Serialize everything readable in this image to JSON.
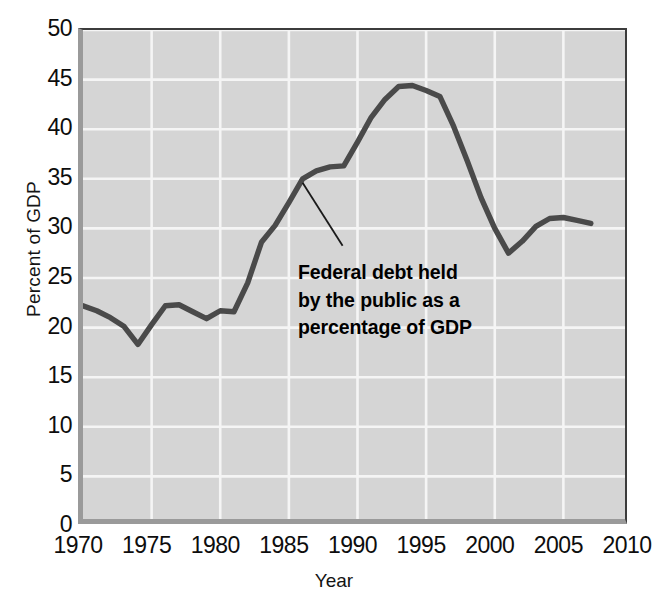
{
  "chart_data": {
    "type": "line",
    "title": "",
    "xlabel": "Year",
    "ylabel": "Percent of GDP",
    "xlim": [
      1970,
      2010
    ],
    "ylim": [
      0,
      50
    ],
    "grid": true,
    "legend": "none",
    "x_ticks": [
      "1970",
      "1975",
      "1980",
      "1985",
      "1990",
      "1995",
      "2000",
      "2005",
      "2010"
    ],
    "y_ticks": [
      "0",
      "5",
      "10",
      "15",
      "20",
      "25",
      "30",
      "35",
      "40",
      "45",
      "50"
    ],
    "x_tick_values": [
      1970,
      1975,
      1980,
      1985,
      1990,
      1995,
      2000,
      2005,
      2010
    ],
    "y_tick_values": [
      0,
      5,
      10,
      15,
      20,
      25,
      30,
      35,
      40,
      45,
      50
    ],
    "annotations": [
      {
        "text_lines": [
          "Federal debt held",
          "by the public as a",
          "percentage of GDP"
        ],
        "points_to_year": 1986,
        "points_to_value": 34.6
      }
    ],
    "series": [
      {
        "name": "Federal debt held by the public as a percentage of GDP",
        "color": "#4a4a4a",
        "x": [
          1970,
          1971,
          1972,
          1973,
          1974,
          1975,
          1976,
          1977,
          1978,
          1979,
          1980,
          1981,
          1982,
          1983,
          1984,
          1985,
          1986,
          1987,
          1988,
          1989,
          1990,
          1991,
          1992,
          1993,
          1994,
          1995,
          1996,
          1997,
          1998,
          1999,
          2000,
          2001,
          2002,
          2003,
          2004,
          2005,
          2006,
          2007
        ],
        "values": [
          22.2,
          21.7,
          21.0,
          20.1,
          18.3,
          20.3,
          22.2,
          22.3,
          21.6,
          20.9,
          21.7,
          21.6,
          24.5,
          28.6,
          30.3,
          32.6,
          35.0,
          35.8,
          36.2,
          36.3,
          38.7,
          41.2,
          43.0,
          44.3,
          44.4,
          43.9,
          43.3,
          40.3,
          36.8,
          33.1,
          30.0,
          27.5,
          28.7,
          30.2,
          31.0,
          31.1,
          30.8,
          30.5
        ]
      }
    ],
    "colors": {
      "line": "#4a4a4a",
      "plot_background": "#d5d5d5",
      "gridline": "#f5f5f5",
      "frame": "#3c3c3c",
      "text": "#0d0d0d"
    }
  },
  "axes": {
    "y_title": "Percent of GDP",
    "x_title": "Year"
  }
}
